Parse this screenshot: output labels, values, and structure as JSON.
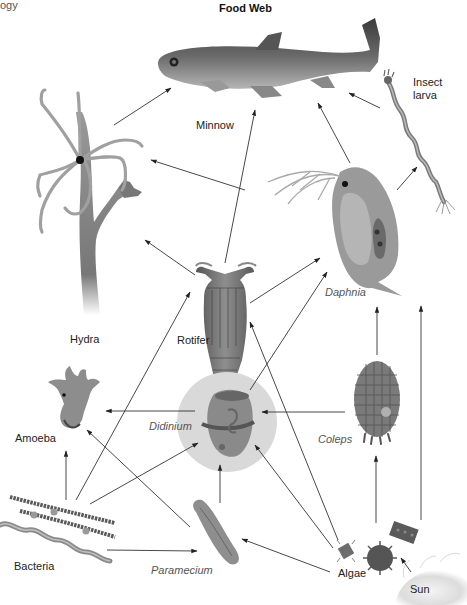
{
  "header": {
    "left_text": "ogy",
    "title": "Food Web"
  },
  "organisms": [
    {
      "id": "minnow",
      "label": "Minnow",
      "italic": false
    },
    {
      "id": "insect_larva",
      "label": "Insect\nlarva",
      "italic": false,
      "label_lines": [
        "Insect",
        "larva"
      ]
    },
    {
      "id": "hydra",
      "label": "Hydra",
      "italic": false
    },
    {
      "id": "rotifer",
      "label": "Rotifer",
      "italic": false
    },
    {
      "id": "daphnia",
      "label": "Daphnia",
      "italic": true
    },
    {
      "id": "amoeba",
      "label": "Amoeba",
      "italic": false
    },
    {
      "id": "didinium",
      "label": "Didinium",
      "italic": true
    },
    {
      "id": "coleps",
      "label": "Coleps",
      "italic": true
    },
    {
      "id": "bacteria",
      "label": "Bacteria",
      "italic": false
    },
    {
      "id": "paramecium",
      "label": "Paramecium",
      "italic": true
    },
    {
      "id": "algae",
      "label": "Algae",
      "italic": false
    },
    {
      "id": "sun",
      "label": "Sun",
      "italic": false
    }
  ],
  "energy_flows": [
    {
      "from": "hydra",
      "to": "minnow"
    },
    {
      "from": "rotifer",
      "to": "minnow"
    },
    {
      "from": "daphnia",
      "to": "minnow"
    },
    {
      "from": "insect_larva",
      "to": "minnow"
    },
    {
      "from": "daphnia",
      "to": "insect_larva"
    },
    {
      "from": "daphnia",
      "to": "hydra"
    },
    {
      "from": "rotifer",
      "to": "hydra"
    },
    {
      "from": "rotifer",
      "to": "daphnia"
    },
    {
      "from": "didinium",
      "to": "daphnia"
    },
    {
      "from": "coleps",
      "to": "daphnia"
    },
    {
      "from": "algae",
      "to": "daphnia"
    },
    {
      "from": "bacteria",
      "to": "rotifer"
    },
    {
      "from": "algae",
      "to": "rotifer"
    },
    {
      "from": "didinium",
      "to": "amoeba"
    },
    {
      "from": "coleps",
      "to": "didinium"
    },
    {
      "from": "bacteria",
      "to": "didinium"
    },
    {
      "from": "paramecium",
      "to": "didinium"
    },
    {
      "from": "algae",
      "to": "didinium"
    },
    {
      "from": "bacteria",
      "to": "amoeba"
    },
    {
      "from": "paramecium",
      "to": "amoeba"
    },
    {
      "from": "bacteria",
      "to": "paramecium"
    },
    {
      "from": "algae",
      "to": "paramecium"
    },
    {
      "from": "algae",
      "to": "coleps"
    },
    {
      "from": "sun",
      "to": "algae"
    }
  ],
  "colors": {
    "arrow": "#333333",
    "organism_dark": "#4a4a4a",
    "organism_mid": "#8a8a8a",
    "organism_light": "#c4c4c4",
    "didinium_highlight": "#d9d9d9"
  }
}
